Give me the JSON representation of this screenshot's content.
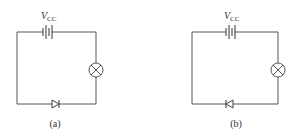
{
  "figure": {
    "type": "circuit-diagram"
  },
  "circuits": [
    {
      "id": "a",
      "caption": "(a)",
      "source": {
        "symbol": "V",
        "subscript": "CC",
        "component": "battery"
      },
      "load": {
        "component": "lamp"
      },
      "diode": {
        "component": "diode",
        "orientation": "forward-pointing-right"
      }
    },
    {
      "id": "b",
      "caption": "(b)",
      "source": {
        "symbol": "V",
        "subscript": "CC",
        "component": "battery"
      },
      "load": {
        "component": "lamp"
      },
      "diode": {
        "component": "diode",
        "orientation": "reverse-pointing-left"
      }
    }
  ],
  "colors": {
    "wire": "#555555",
    "background": "#ffffff",
    "text": "#333333"
  }
}
